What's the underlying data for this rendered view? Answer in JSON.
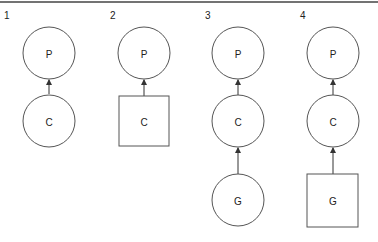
{
  "figure": {
    "panels": [
      {
        "number": "1",
        "nodes": [
          {
            "label": "P",
            "shape": "circle"
          },
          {
            "label": "C",
            "shape": "circle"
          }
        ],
        "edges": [
          [
            "C",
            "P"
          ]
        ]
      },
      {
        "number": "2",
        "nodes": [
          {
            "label": "P",
            "shape": "circle"
          },
          {
            "label": "C",
            "shape": "square"
          }
        ],
        "edges": [
          [
            "C",
            "P"
          ]
        ]
      },
      {
        "number": "3",
        "nodes": [
          {
            "label": "P",
            "shape": "circle"
          },
          {
            "label": "C",
            "shape": "circle"
          },
          {
            "label": "G",
            "shape": "circle"
          }
        ],
        "edges": [
          [
            "C",
            "P"
          ],
          [
            "G",
            "C"
          ]
        ]
      },
      {
        "number": "4",
        "nodes": [
          {
            "label": "P",
            "shape": "circle"
          },
          {
            "label": "C",
            "shape": "circle"
          },
          {
            "label": "G",
            "shape": "square"
          }
        ],
        "edges": [
          [
            "C",
            "P"
          ],
          [
            "G",
            "C"
          ]
        ]
      }
    ]
  },
  "colors": {
    "stroke": "#555555",
    "rule": "#444444",
    "text": "#222222"
  }
}
